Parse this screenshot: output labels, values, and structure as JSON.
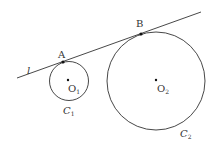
{
  "diagram": {
    "line_label": "l",
    "point_a": "A",
    "point_b": "B",
    "center1": "O",
    "center1_sub": "1",
    "center2": "O",
    "center2_sub": "2",
    "circle1": "C",
    "circle1_sub": "1",
    "circle2": "C",
    "circle2_sub": "2",
    "stroke_color": "#333333"
  }
}
